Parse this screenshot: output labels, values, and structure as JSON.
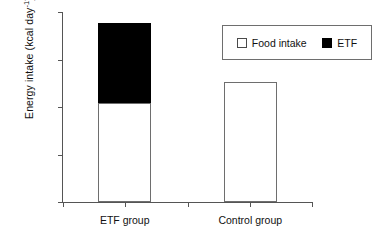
{
  "chart_data": {
    "type": "bar",
    "title": "",
    "subtitle": "",
    "xlabel": "",
    "ylabel": "Energy intake (kcal day",
    "ylabel_exponent": "-1",
    "ylabel_close": ")",
    "categories": [
      "ETF group",
      "Control group"
    ],
    "series": [
      {
        "name": "Food intake",
        "values": [
          1040,
          1260
        ],
        "color": "#ffffff"
      },
      {
        "name": "ETF",
        "values": [
          840,
          0
        ],
        "color": "#000000"
      }
    ],
    "totals": [
      1880,
      1260
    ],
    "stacked": true,
    "ylim": [
      0,
      2000
    ],
    "yticks": [
      0,
      500,
      1000,
      1500,
      2000
    ],
    "ytick_labels": [
      "0",
      "500",
      "1000",
      "1500",
      "2000"
    ],
    "grid": false,
    "legend_position": "top-right",
    "legend_entries": [
      {
        "label": "Food intake",
        "swatch": "white"
      },
      {
        "label": "ETF",
        "swatch": "black"
      }
    ]
  },
  "axis": {
    "y_title_main": "Energy intake (kcal day",
    "y_title_sup": "-1",
    "y_title_end": ")"
  }
}
